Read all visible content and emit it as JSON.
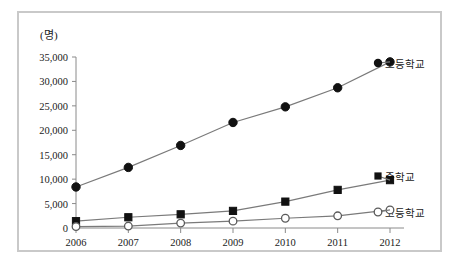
{
  "chart_data": {
    "type": "line",
    "title": "",
    "subtitle": "",
    "unit_label": "(명)",
    "xlabel": "",
    "ylabel": "",
    "categories": [
      "2006",
      "2007",
      "2008",
      "2009",
      "2010",
      "2011",
      "2012"
    ],
    "x_tick_labels": [
      "2006",
      "2007",
      "2008",
      "2009",
      "2010",
      "2011",
      "2012"
    ],
    "y_tick_labels": [
      "0",
      "5,000",
      "10,000",
      "15,000",
      "20,000",
      "25,000",
      "30,000",
      "35,000"
    ],
    "y_tick_values": [
      0,
      5000,
      10000,
      15000,
      20000,
      25000,
      30000,
      35000
    ],
    "ylim": [
      0,
      35000
    ],
    "grid": false,
    "legend_position": "right-inline",
    "series": [
      {
        "name": "초등학교",
        "marker": "filled-circle",
        "color": "#111111",
        "values": [
          8400,
          12400,
          16900,
          21600,
          24800,
          28700,
          34000
        ]
      },
      {
        "name": "중학교",
        "marker": "filled-square",
        "color": "#111111",
        "values": [
          1400,
          2200,
          2800,
          3500,
          5400,
          7800,
          9800
        ]
      },
      {
        "name": "고등학교",
        "marker": "open-circle",
        "color": "#111111",
        "values": [
          300,
          400,
          1000,
          1400,
          2000,
          2500,
          3700
        ]
      }
    ]
  },
  "colors": {
    "frame_border": "#c9c9c9",
    "axis": "#8a8a8a",
    "line": "#7a7a7a",
    "marker_fill": "#111111",
    "marker_open_fill": "#ffffff",
    "text": "#1a1a1a",
    "background": "#ffffff"
  }
}
